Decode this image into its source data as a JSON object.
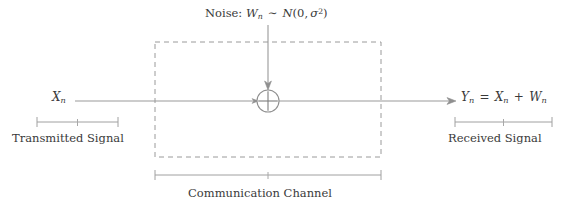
{
  "figure": {
    "title_text": "",
    "noise_label": {
      "prefix": "Noise:",
      "variable": "W",
      "variable_sub": "n",
      "relation": "∼",
      "distribution": "N",
      "dist_mean": "0",
      "dist_variance_symbol": "σ",
      "dist_variance_exponent": "2",
      "full_text": "Noise: W_n ~ N(0, σ²)"
    },
    "input_symbol": {
      "variable": "X",
      "subscript": "n",
      "full_text": "X_n"
    },
    "output_equation": {
      "lhs_variable": "Y",
      "lhs_subscript": "n",
      "equals": "=",
      "term1_variable": "X",
      "term1_subscript": "n",
      "plus": "+",
      "term2_variable": "W",
      "term2_subscript": "n",
      "full_text": "Y_n = X_n + W_n"
    },
    "adder": {
      "symbol": "⊕",
      "operation": "plus",
      "center_x": 268,
      "center_y": 101,
      "radius": 11
    },
    "channel_box": {
      "style": "dashed",
      "x": 155,
      "y": 42,
      "width": 226,
      "height": 115
    },
    "brackets": [
      {
        "name": "transmitted-signal",
        "caption": "Transmitted Signal",
        "x_start": 37,
        "x_end": 118,
        "y": 122
      },
      {
        "name": "received-signal",
        "caption": "Received Signal",
        "x_start": 455,
        "x_end": 552,
        "y": 122
      },
      {
        "name": "communication-channel",
        "caption": "Communication Channel",
        "x_start": 155,
        "x_end": 381,
        "y": 175
      }
    ],
    "signal_path": {
      "y": 101,
      "x_start": 75,
      "x_arrow_tip": 456,
      "direction": "left-to-right"
    },
    "noise_path": {
      "x": 268,
      "y_start": 25,
      "y_arrow_tip": 88,
      "direction": "top-to-bottom"
    },
    "colors": {
      "line": "#999999",
      "text": "#3a3a3a",
      "dashed_box": "#9a9a9a",
      "background": "#ffffff"
    }
  }
}
